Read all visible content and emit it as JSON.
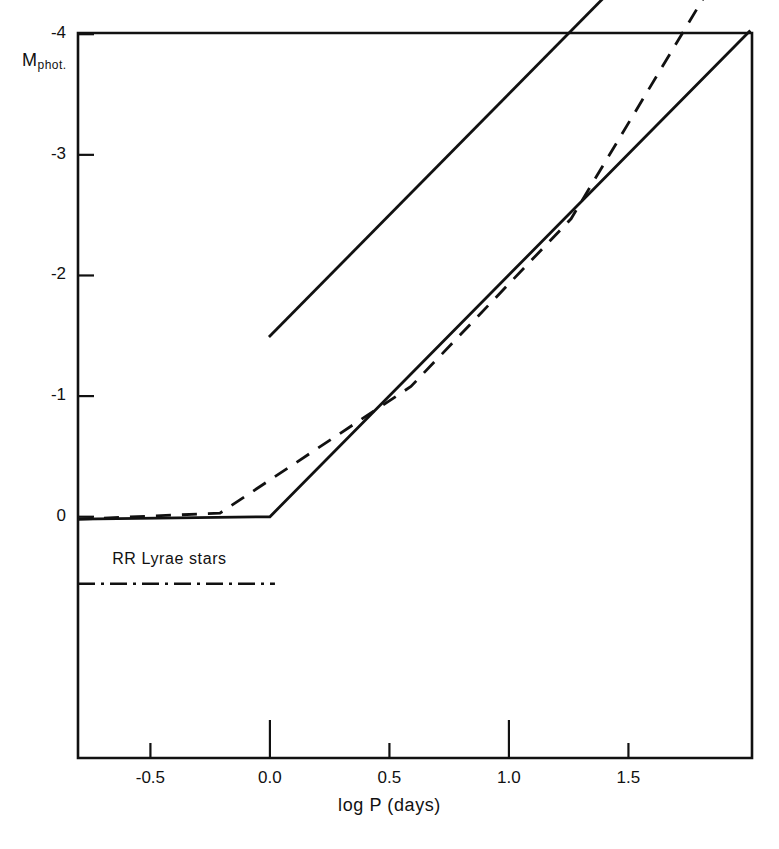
{
  "chart_data": {
    "type": "line",
    "title": "",
    "subtitle": "",
    "xlabel": "log P (days)",
    "ylabel": "M_phot.",
    "ylabel_base": "M",
    "ylabel_sub": "phot.",
    "xlim": [
      -0.803,
      2.017
    ],
    "ylim": [
      2.0,
      -4.01
    ],
    "y_inverted": true,
    "grid": false,
    "legend": "none",
    "xticks": [
      -0.5,
      0.0,
      0.5,
      1.0,
      1.5
    ],
    "xtick_labels": [
      "-0.5",
      "0.0",
      "0.5",
      "1.0",
      "1.5"
    ],
    "yticks": [
      0,
      -1,
      -2,
      -3,
      -4
    ],
    "ytick_labels": [
      "0",
      "-1",
      "-2",
      "-3",
      "-4"
    ],
    "series": [
      {
        "name": "upper-solid-line",
        "style": "solid",
        "color": "#111111",
        "x": [
          -0.004,
          1.525
        ],
        "y": [
          -1.49,
          -4.56
        ]
      },
      {
        "name": "lower-solid-line",
        "style": "solid",
        "color": "#111111",
        "x": [
          -0.803,
          0.0,
          2.01
        ],
        "y": [
          0.02,
          0.0,
          -4.03
        ]
      },
      {
        "name": "dashed-line",
        "style": "dashed",
        "color": "#111111",
        "x": [
          -0.803,
          -0.209,
          0.59,
          1.26,
          2.017
        ],
        "y": [
          0.02,
          -0.03,
          -1.08,
          -2.47,
          -4.97
        ]
      },
      {
        "name": "rr-lyrae-marker-line",
        "style": "dash-dot",
        "color": "#111111",
        "x": [
          -0.803,
          0.021
        ],
        "y": [
          0.556,
          0.556
        ]
      }
    ],
    "annotations": [
      {
        "name": "rr-lyrae-stars-label",
        "text": "RR Lyrae stars",
        "x": -0.66,
        "y": 0.37
      }
    ]
  }
}
